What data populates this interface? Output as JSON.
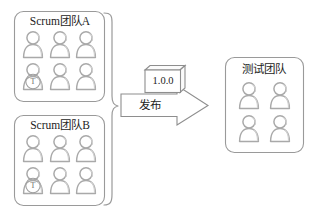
{
  "diagram": {
    "title_semantic": "scrum-teams-release-to-test-team",
    "colors": {
      "box_border": "#9a9a9a",
      "person_outline": "#a9a9a9",
      "arrow_border": "#8e8e8e",
      "text": "#1d1d1d",
      "background": "#ffffff"
    },
    "source_group": {
      "brace_label": "",
      "teams": [
        {
          "id": "scrum-team-a",
          "title": "Scrum团队A",
          "member_count": 6,
          "members": [
            {
              "badge": ""
            },
            {
              "badge": ""
            },
            {
              "badge": ""
            },
            {
              "badge": "T"
            },
            {
              "badge": ""
            },
            {
              "badge": ""
            }
          ]
        },
        {
          "id": "scrum-team-b",
          "title": "Scrum团队B",
          "member_count": 6,
          "members": [
            {
              "badge": ""
            },
            {
              "badge": ""
            },
            {
              "badge": ""
            },
            {
              "badge": "T"
            },
            {
              "badge": ""
            },
            {
              "badge": ""
            }
          ]
        }
      ]
    },
    "artifact": {
      "id": "release-package",
      "version": "1.0.0"
    },
    "flow_arrow": {
      "id": "release-arrow",
      "label": "发布",
      "direction": "right"
    },
    "target_team": {
      "id": "test-team",
      "title": "测试团队",
      "member_count": 4,
      "members": [
        {
          "badge": ""
        },
        {
          "badge": ""
        },
        {
          "badge": ""
        },
        {
          "badge": ""
        }
      ]
    }
  }
}
